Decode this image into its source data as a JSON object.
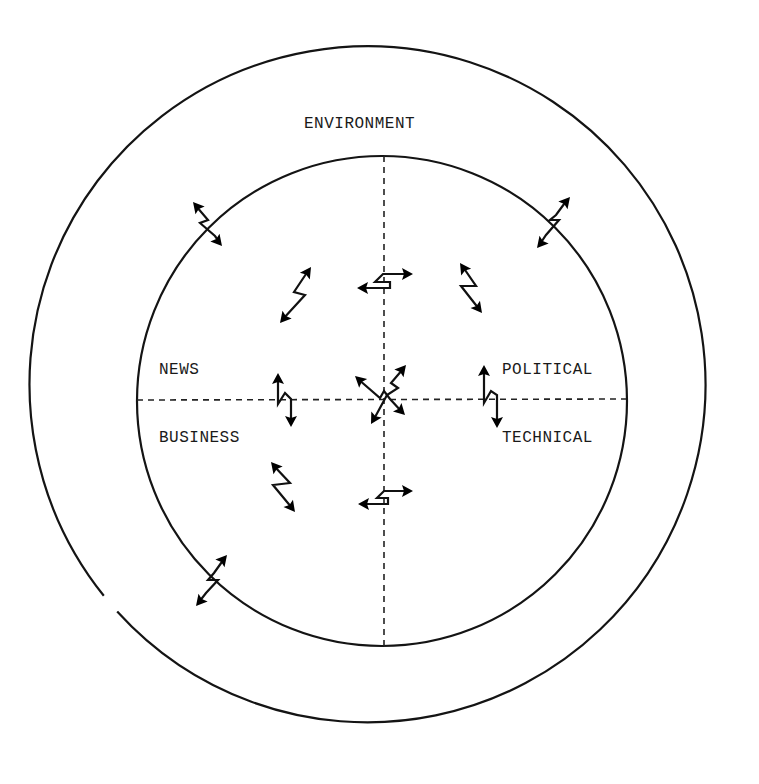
{
  "diagram": {
    "title": "",
    "colors": {
      "ink": "#141414",
      "background": "#ffffff"
    },
    "outer_ring": {
      "label": "ENVIRONMENT",
      "cx": 383,
      "cy": 407,
      "r": 338
    },
    "inner_circle": {
      "cx": 382,
      "cy": 401,
      "r": 245
    },
    "quadrant_labels": {
      "top_left": "NEWS",
      "top_right": "POLITICAL",
      "bottom_left": "BUSINESS",
      "bottom_right": "TECHNICAL"
    },
    "arrows": [
      {
        "id": "boundary-upper-left",
        "type": "zigzag-double-arrow",
        "location": "inner boundary, upper-left",
        "orientation": "diagonal NW-SE"
      },
      {
        "id": "boundary-upper-right",
        "type": "zigzag-double-arrow",
        "location": "inner boundary, upper-right",
        "orientation": "diagonal NE-SW"
      },
      {
        "id": "boundary-lower-left",
        "type": "zigzag-double-arrow",
        "location": "inner boundary, lower-left",
        "orientation": "diagonal NE-SW"
      },
      {
        "id": "news-diagonal",
        "type": "zigzag-double-arrow",
        "location": "NEWS quadrant",
        "orientation": "diagonal NE-SW"
      },
      {
        "id": "top-axis",
        "type": "zigzag-double-arrow",
        "location": "vertical axis, upper",
        "orientation": "horizontal"
      },
      {
        "id": "political-diagonal",
        "type": "zigzag-double-arrow",
        "location": "POLITICAL quadrant",
        "orientation": "diagonal NW-SE"
      },
      {
        "id": "left-axis",
        "type": "zigzag-double-arrow",
        "location": "horizontal axis, left",
        "orientation": "vertical"
      },
      {
        "id": "center",
        "type": "crossed-zigzag-double-arrows",
        "location": "centre",
        "orientation": "both diagonals"
      },
      {
        "id": "right-axis",
        "type": "zigzag-double-arrow",
        "location": "horizontal axis, right",
        "orientation": "vertical"
      },
      {
        "id": "business-diagonal",
        "type": "zigzag-double-arrow",
        "location": "BUSINESS quadrant",
        "orientation": "diagonal NW-SE"
      },
      {
        "id": "bottom-axis",
        "type": "zigzag-double-arrow",
        "location": "vertical axis, lower",
        "orientation": "horizontal"
      }
    ]
  }
}
